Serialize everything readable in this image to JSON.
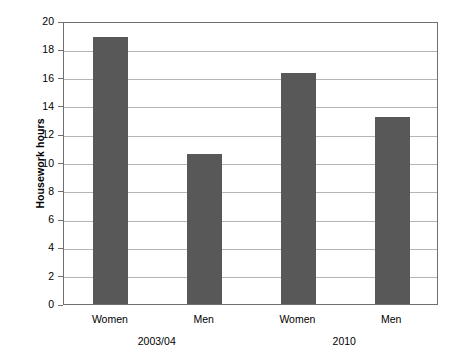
{
  "chart_data": {
    "type": "bar",
    "title": "",
    "xlabel": "",
    "ylabel": "Housework hours",
    "ylim": [
      0,
      20
    ],
    "ytick_step": 2,
    "yticks": [
      "20",
      "18",
      "16",
      "14",
      "12",
      "10",
      "8",
      "6",
      "4",
      "2",
      "0"
    ],
    "grid": true,
    "legend": "none",
    "categories": [
      "Women",
      "Men",
      "Women",
      "Men"
    ],
    "groups": [
      {
        "label": "2003/04",
        "categories": [
          "Women",
          "Men"
        ],
        "values": [
          18.9,
          10.6
        ]
      },
      {
        "label": "2010",
        "categories": [
          "Women",
          "Men"
        ],
        "values": [
          16.3,
          13.2
        ]
      }
    ],
    "values": [
      18.9,
      10.6,
      16.3,
      13.2
    ],
    "bar_color": "#585858",
    "gridline_color": "#b5b5b5",
    "frame_color": "#6f6f6f"
  }
}
